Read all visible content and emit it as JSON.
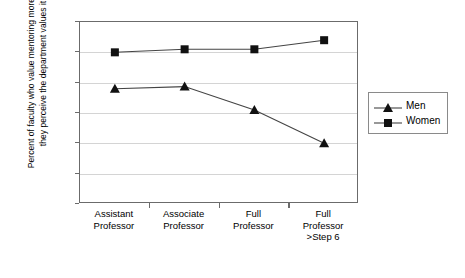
{
  "chart_data": {
    "type": "line",
    "title": "",
    "xlabel": "",
    "ylabel": "Percent of faculty who value mentoring more than they perceive the department values it",
    "ylim": [
      0,
      60
    ],
    "ytick_step": 10,
    "yticks": [
      "0",
      "10",
      "20",
      "30",
      "40",
      "50",
      "60"
    ],
    "grid": true,
    "legend_position": "right",
    "categories": [
      "Assistant\nProfessor",
      "Associate\nProfessor",
      "Full\nProfessor",
      "Full\nProfessor\n>Step 6"
    ],
    "category_lines": [
      [
        "Assistant",
        "Professor"
      ],
      [
        "Associate",
        "Professor"
      ],
      [
        "Full",
        "Professor"
      ],
      [
        "Full",
        "Professor",
        ">Step 6"
      ]
    ],
    "series": [
      {
        "name": "Men",
        "marker": "triangle",
        "color": "#111111",
        "values": [
          38,
          38.7,
          31,
          20
        ]
      },
      {
        "name": "Women",
        "marker": "square",
        "color": "#111111",
        "values": [
          50,
          51,
          51,
          54
        ]
      }
    ]
  },
  "legend": {
    "items": [
      {
        "label": "Men",
        "marker": "triangle-marker-icon"
      },
      {
        "label": "Women",
        "marker": "square-marker-icon"
      }
    ]
  }
}
